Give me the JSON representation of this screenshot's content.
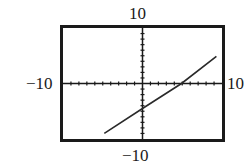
{
  "chart_data": {
    "type": "line",
    "title": "",
    "xlabel": "",
    "ylabel": "",
    "xlim": [
      -10,
      10
    ],
    "ylim": [
      -10,
      10
    ],
    "window_labels": {
      "ymax": "10",
      "ymin": "−10",
      "xmin": "−10",
      "xmax": "10"
    },
    "grid": false,
    "axes_ticks": {
      "x_scale": 1,
      "y_scale": 1
    },
    "series": [
      {
        "name": "line",
        "x": [
          -4.8,
          0,
          4.9,
          9.3
        ],
        "y": [
          -9.0,
          -4.5,
          0,
          4.9
        ]
      }
    ],
    "annotations": {
      "y_intercept": -4.5,
      "x_intercept": 4.9
    },
    "colors": {
      "frame": "#1a1a1a",
      "axis": "#1a1a1a",
      "line": "#2a2a2a",
      "background": "#ffffff"
    }
  }
}
